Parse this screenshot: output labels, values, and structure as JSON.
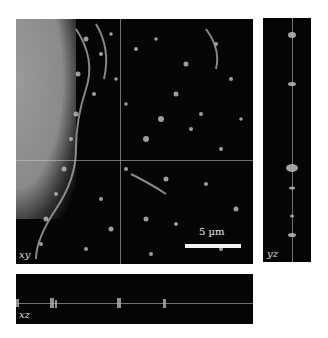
{
  "figure": {
    "panels": {
      "xy": {
        "label": "xy"
      },
      "yz": {
        "label": "yz"
      },
      "xz": {
        "label": "xz"
      }
    },
    "scale_bar": {
      "label": "5 µm"
    },
    "colors": {
      "background": "#050505",
      "signal": "#bfbfbf",
      "crosshair": "#c8c8c8"
    }
  }
}
